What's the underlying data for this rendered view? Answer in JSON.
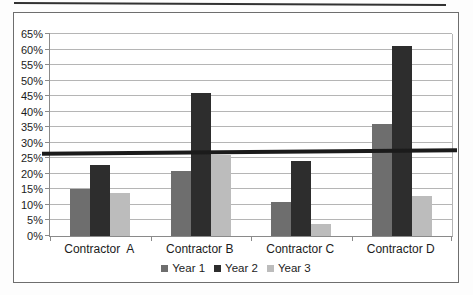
{
  "chart_data": {
    "type": "bar",
    "title": "",
    "xlabel": "",
    "ylabel": "",
    "categories": [
      "Contractor  A",
      "Contractor B",
      "Contractor C",
      "Contractor D"
    ],
    "series": [
      {
        "name": "Year 1",
        "color": "#6e6e6e",
        "values": [
          15,
          21,
          11,
          36
        ]
      },
      {
        "name": "Year 2",
        "color": "#2d2d2d",
        "values": [
          23,
          46,
          24,
          61
        ]
      },
      {
        "name": "Year 3",
        "color": "#bcbcbc",
        "values": [
          14,
          26,
          4,
          13
        ]
      }
    ],
    "ylim": [
      0,
      65
    ],
    "ytick_step": 5,
    "yticks": [
      "0%",
      "5%",
      "10%",
      "15%",
      "20%",
      "25%",
      "30%",
      "35%",
      "40%",
      "45%",
      "50%",
      "55%",
      "60%",
      "65%"
    ],
    "grid": true,
    "gridline_color": "#b5b5b5",
    "reference_line": {
      "value": 27,
      "color": "#1b1b1b",
      "thickness_px": 4
    },
    "legend": {
      "position": "bottom",
      "entries": [
        "Year 1",
        "Year 2",
        "Year 3"
      ]
    }
  },
  "frame": {
    "border_color": "#6e6e6e",
    "background": "#ffffff"
  }
}
